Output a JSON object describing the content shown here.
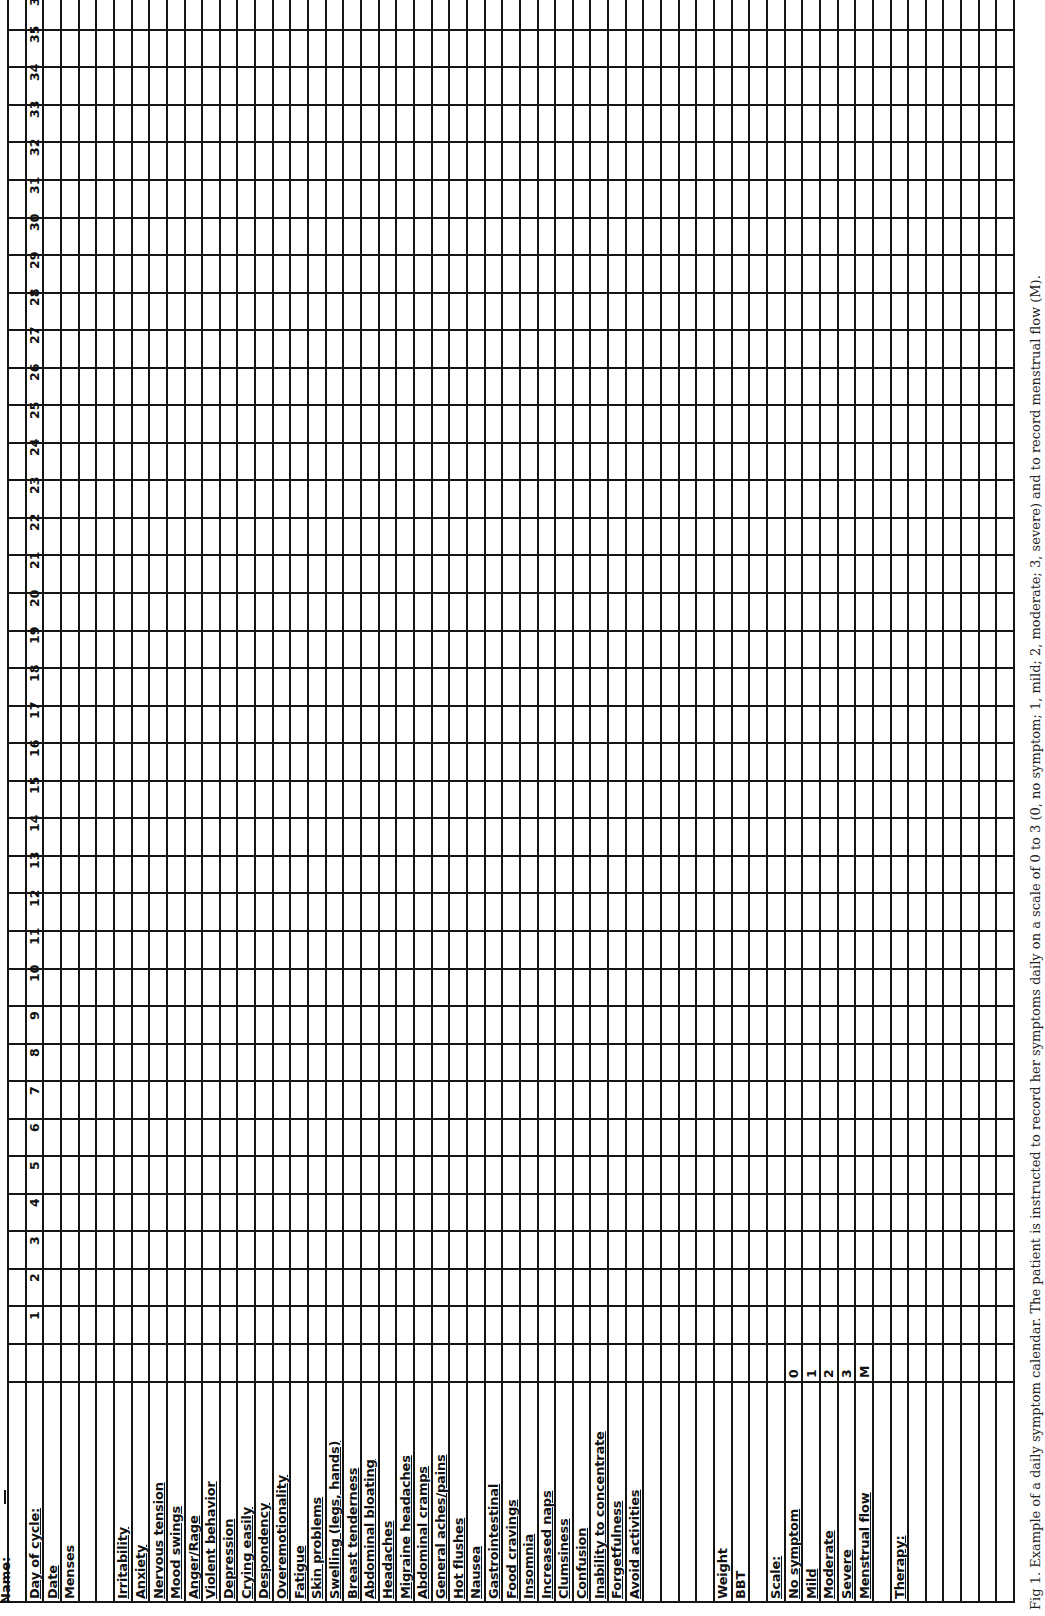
{
  "form": {
    "name_label": "Name:",
    "day_of_cycle_label": "Day of cycle:",
    "date_label": "Date",
    "menses_label": "Menses",
    "days": [
      "1",
      "2",
      "3",
      "4",
      "5",
      "6",
      "7",
      "8",
      "9",
      "10",
      "11",
      "12",
      "13",
      "14",
      "15",
      "16",
      "17",
      "18",
      "19",
      "20",
      "21",
      "22",
      "23",
      "24",
      "25",
      "26",
      "27",
      "28",
      "29",
      "30",
      "31",
      "32",
      "33",
      "34",
      "35",
      "36"
    ],
    "symptoms": [
      "Irritability",
      "Anxiety",
      "Nervous tension",
      "Mood swings",
      "Anger/Rage",
      "Violent behavior",
      "Depression",
      "Crying easily",
      "Despondency",
      "Overemotionality",
      "Fatigue",
      "Skin problems",
      "Swelling (legs, hands)",
      "Breast tenderness",
      "Abdominal bloating",
      "Headaches",
      "Migraine headaches",
      "Abdominal cramps",
      "General aches/pains",
      "Hot flushes",
      "Nausea",
      "Gastrointestinal",
      "Food cravings",
      "Insomnia",
      "Increased naps",
      "Clumsiness",
      "Confusion",
      "Inability to concentrate",
      "Forgetfulness",
      "Avoid activities"
    ],
    "weight_label": "Weight",
    "bbt_label": "BBT",
    "scale": {
      "title": "Scale:",
      "items": [
        {
          "label": "No symptom",
          "value": "0"
        },
        {
          "label": "Mild",
          "value": "1"
        },
        {
          "label": "Moderate",
          "value": "2"
        },
        {
          "label": "Severe",
          "value": "3"
        },
        {
          "label": "Menstrual flow",
          "value": "M"
        }
      ]
    },
    "therapy_label": "Therapy:"
  },
  "caption": {
    "text": "Fig 1. Example of a daily symptom calendar. The patient is instructed to record her symptoms daily on a scale of 0 to 3 (0, no symptom; 1, mild; 2, moderate; 3, severe) and to record menstrual flow (M)."
  }
}
